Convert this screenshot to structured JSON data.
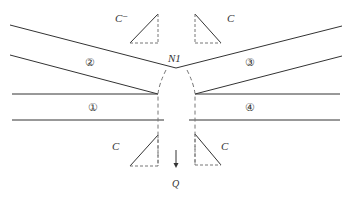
{
  "diagram": {
    "node_label": "N1",
    "flow_label": "Q",
    "stream_labels": [
      "①",
      "②",
      "③",
      "④"
    ],
    "corner_labels": {
      "top_left": "C⁻",
      "top_right": "C",
      "bottom_left": "C",
      "bottom_right": "C"
    },
    "colors": {
      "line": "#333333",
      "dashed": "#777777",
      "background": "#ffffff"
    }
  }
}
